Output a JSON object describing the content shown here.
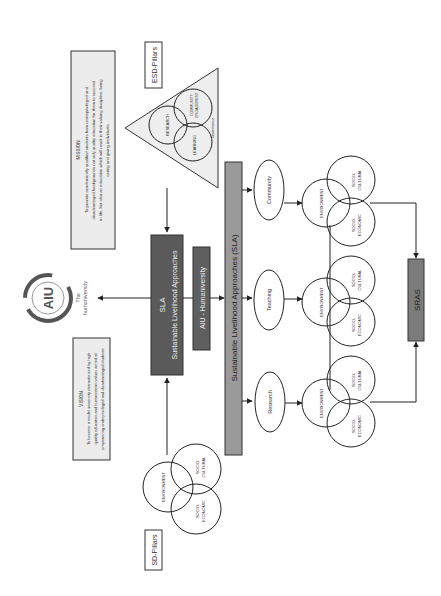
{
  "diagram": {
    "orientation": "rotated-90-ccw",
    "colors": {
      "background": "#ffffff",
      "line": "#222222",
      "dark_box": "#5a5a5a",
      "mid_box": "#9a9a9a",
      "light_box": "#ececec",
      "triangle_fill": "#eeeeee"
    },
    "mission": {
      "title": "MISSION",
      "lines": [
        "To provide academically qualified students from underprivileged and",
        "disadvantaged backgrounds not only quality education for them to succeed",
        "in life, but also an education which will result in their valuing discipline, being",
        "caring and giving individuals."
      ]
    },
    "esd_pillars": {
      "label": "ESD-Pillars",
      "circles": [
        "RESEARCH",
        "COMMUNITY ENGAGEMENT",
        "LEARNING"
      ],
      "base_label": "Governance"
    },
    "sla_box": {
      "title": "SLA",
      "subtitle": "Sustainable Livelihood Approaches"
    },
    "aiu_box": {
      "label": "AIU - Humaniversity"
    },
    "logo": {
      "mark": "AIU",
      "caption_1": "The",
      "caption_2": "humaniversity"
    },
    "vision": {
      "title": "VISION",
      "lines": [
        "To become a model university characterized by high",
        "quality education and humanitarian values aimed at",
        "empowering underprivileged and disadvantaged students"
      ]
    },
    "sd_pillars": {
      "label": "SD-Pillars",
      "circles": [
        "ENVIRONMENT",
        "SOCIO-CULTURAL",
        "SOCIO-ECONOMIC"
      ]
    },
    "sla_bar": {
      "label": "Sustainable Livelihood Approaches (SLA)"
    },
    "activities": [
      {
        "label": "Community"
      },
      {
        "label": "Teaching"
      },
      {
        "label": "Research"
      }
    ],
    "venn_labels": {
      "environment": "ENVIRONMENT",
      "socio_cultural_1": "SOCIO-",
      "socio_cultural_2": "CULTURAL",
      "socio_economic_1": "SOCIO-",
      "socio_economic_2": "ECONOMIC"
    },
    "sras": {
      "label": "SRAS"
    }
  }
}
